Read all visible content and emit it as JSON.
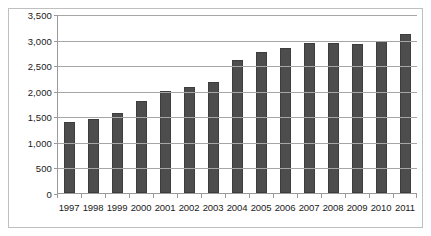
{
  "chart_data": {
    "type": "bar",
    "title": "",
    "subtitle": "",
    "xlabel": "",
    "ylabel": "",
    "categories": [
      "1997",
      "1998",
      "1999",
      "2000",
      "2001",
      "2002",
      "2003",
      "2004",
      "2005",
      "2006",
      "2007",
      "2008",
      "2009",
      "2010",
      "2011"
    ],
    "values": [
      1390,
      1440,
      1560,
      1800,
      2000,
      2080,
      2170,
      2610,
      2760,
      2830,
      2940,
      2940,
      2910,
      2980,
      3110
    ],
    "series": [
      {
        "name": "",
        "values": [
          1390,
          1440,
          1560,
          1800,
          2000,
          2080,
          2170,
          2610,
          2760,
          2830,
          2940,
          2940,
          2910,
          2980,
          3110
        ]
      }
    ],
    "ylim": [
      0,
      3500
    ],
    "ytick_values": [
      0,
      500,
      1000,
      1500,
      2000,
      2500,
      3000,
      3500
    ],
    "ytick_labels": [
      "0",
      "500",
      "1,000",
      "1,500",
      "2,000",
      "2,500",
      "3,000",
      "3,500"
    ],
    "grid": true,
    "grid_axis": "y",
    "legend": false,
    "legend_position": "none",
    "bar_color": "#4d4d4d",
    "gridline_color": "#a6a6a6",
    "axis_color": "#9a9a9a",
    "border_color": "#bfbfbf",
    "text_color": "#1a1a1a",
    "background_color": "#ffffff"
  }
}
